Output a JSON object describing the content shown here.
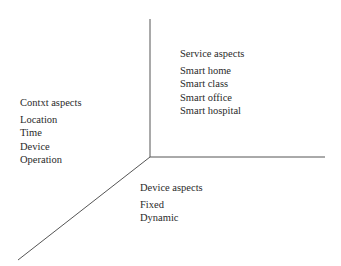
{
  "diagram": {
    "type": "three-axis aspect diagram",
    "axes": {
      "vertical": {
        "x1": 150,
        "y1": 19,
        "x2": 150,
        "y2": 157
      },
      "horizontal": {
        "x1": 150,
        "y1": 157,
        "x2": 325,
        "y2": 157
      },
      "diagonal": {
        "x1": 150,
        "y1": 157,
        "x2": 18,
        "y2": 260
      },
      "color": "#555555"
    },
    "service": {
      "title": "Service aspects",
      "items": [
        "Smart home",
        "Smart class",
        "Smart office",
        "Smart hospital"
      ]
    },
    "context": {
      "title": "Contxt aspects",
      "items": [
        "Location",
        "Time",
        "Device",
        "Operation"
      ]
    },
    "device": {
      "title": "Device aspects",
      "items": [
        "Fixed",
        "Dynamic"
      ]
    }
  }
}
